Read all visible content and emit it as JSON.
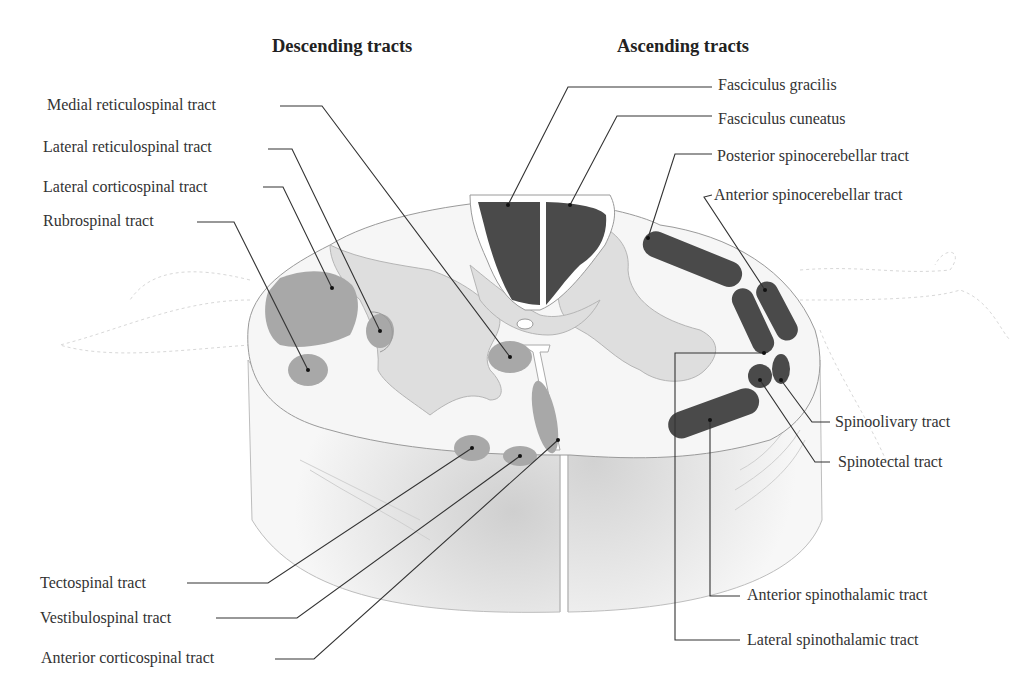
{
  "headings": {
    "descending": "Descending tracts",
    "ascending": "Ascending tracts"
  },
  "descending_tracts": [
    {
      "id": "medial-reticulospinal",
      "label": "Medial reticulospinal tract"
    },
    {
      "id": "lateral-reticulospinal",
      "label": "Lateral reticulospinal tract"
    },
    {
      "id": "lateral-corticospinal",
      "label": "Lateral corticospinal tract"
    },
    {
      "id": "rubrospinal",
      "label": "Rubrospinal tract"
    },
    {
      "id": "tectospinal",
      "label": "Tectospinal tract"
    },
    {
      "id": "vestibulospinal",
      "label": "Vestibulospinal tract"
    },
    {
      "id": "anterior-corticospinal",
      "label": "Anterior corticospinal tract"
    }
  ],
  "ascending_tracts": [
    {
      "id": "fasciculus-gracilis",
      "label": "Fasciculus gracilis"
    },
    {
      "id": "fasciculus-cuneatus",
      "label": "Fasciculus cuneatus"
    },
    {
      "id": "posterior-spinocerebellar",
      "label": "Posterior spinocerebellar tract"
    },
    {
      "id": "anterior-spinocerebellar",
      "label": "Anterior spinocerebellar tract"
    },
    {
      "id": "spinoolivary",
      "label": "Spinoolivary tract"
    },
    {
      "id": "spinotectal",
      "label": "Spinotectal tract"
    },
    {
      "id": "anterior-spinothalamic",
      "label": "Anterior spinothalamic tract"
    },
    {
      "id": "lateral-spinothalamic",
      "label": "Lateral spinothalamic tract"
    }
  ],
  "colors": {
    "ascending_fill": "#4a4a4a",
    "descending_fill": "#a8a8a8",
    "gray_matter": "#dcdcdc",
    "white_matter": "#f4f4f4",
    "leader_line": "#333333"
  }
}
